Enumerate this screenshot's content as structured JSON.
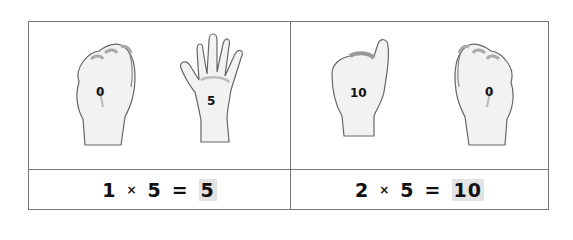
{
  "cards": [
    {
      "hands": [
        {
          "gesture": "fist",
          "label": "0"
        },
        {
          "gesture": "open-hand",
          "label": "5"
        }
      ],
      "equation": {
        "a": "1",
        "op": "×",
        "b": "5",
        "eq": "=",
        "result": "5"
      }
    },
    {
      "hands": [
        {
          "gesture": "thumb-up",
          "label": "10"
        },
        {
          "gesture": "fist",
          "label": "0"
        }
      ],
      "equation": {
        "a": "2",
        "op": "×",
        "b": "5",
        "eq": "=",
        "result": "10"
      }
    }
  ],
  "colors": {
    "border": "#777777",
    "highlight": "#e3e3e3",
    "text": "#111111"
  }
}
